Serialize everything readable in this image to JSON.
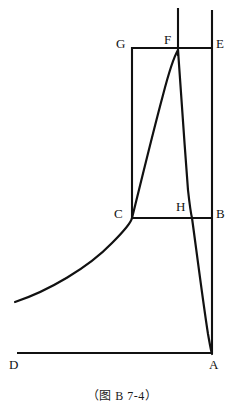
{
  "figure": {
    "caption": "（图 B 7-4）",
    "stroke_color": "#111111",
    "background_color": "#ffffff",
    "width": 244,
    "height": 420,
    "labels": [
      {
        "key": "G",
        "text": "G",
        "x": 116,
        "y": 37
      },
      {
        "key": "F",
        "text": "F",
        "x": 164,
        "y": 33
      },
      {
        "key": "E",
        "text": "E",
        "x": 216,
        "y": 37
      },
      {
        "key": "C",
        "text": "C",
        "x": 114,
        "y": 207
      },
      {
        "key": "H",
        "text": "H",
        "x": 176,
        "y": 200
      },
      {
        "key": "B",
        "text": "B",
        "x": 216,
        "y": 207
      },
      {
        "key": "D",
        "text": "D",
        "x": 9,
        "y": 358
      },
      {
        "key": "A",
        "text": "A",
        "x": 209,
        "y": 358
      }
    ],
    "segments": [
      {
        "name": "axis-vertical-through-f",
        "x1": 178,
        "y1": 8,
        "x2": 178,
        "y2": 56
      },
      {
        "name": "axis-vertical-through-e-b-a",
        "x1": 212,
        "y1": 10,
        "x2": 212,
        "y2": 354
      },
      {
        "name": "line-g-e-top",
        "x1": 131,
        "y1": 48,
        "x2": 213,
        "y2": 48
      },
      {
        "name": "line-c-b-mid",
        "x1": 131,
        "y1": 218,
        "x2": 213,
        "y2": 218
      },
      {
        "name": "rect-left-edge-g-c",
        "x1": 132,
        "y1": 47,
        "x2": 132,
        "y2": 219
      },
      {
        "name": "line-d-a-base",
        "x1": 17,
        "y1": 353,
        "x2": 212,
        "y2": 353
      }
    ],
    "curves": [
      {
        "name": "rising-curve-left-to-f",
        "path": "M 15 302 C 48 291, 88 268, 112 243 C 124 231, 131 223, 132 218 C 140 186, 152 136, 163 95 C 170 68, 175 55, 178 50"
      },
      {
        "name": "falling-curve-f-to-a",
        "path": "M 178 50 C 180 72, 184 140, 188 190 C 190 208, 191 214, 192 218 C 196 247, 203 302, 208 334 C 210 345, 211 351, 212 354"
      }
    ]
  }
}
